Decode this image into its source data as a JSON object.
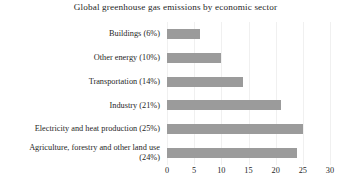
{
  "chart_data": {
    "type": "bar",
    "orientation": "horizontal",
    "title": "Global greenhouse gas emissions  by economic sector",
    "xlabel": "",
    "ylabel": "",
    "xlim": [
      0,
      30
    ],
    "xticks": [
      "0",
      "5",
      "10",
      "15",
      "20",
      "25",
      "30"
    ],
    "grid": "vertical-light",
    "legend": "none",
    "bar_color": "#9b9b9b",
    "background_color": "#ffffff",
    "categories": [
      "Buildings (6%)",
      "Other energy (10%)",
      "Transportation (14%)",
      "Industry (21%)",
      "Electricity and heat production (25%)",
      "Agriculture, forestry and other land use (24%)"
    ],
    "category_lines": [
      [
        "Buildings (6%)"
      ],
      [
        "Other energy (10%)"
      ],
      [
        "Transportation (14%)"
      ],
      [
        "Industry (21%)"
      ],
      [
        "Electricity and heat production (25%)"
      ],
      [
        "Agriculture, forestry and other land use",
        "(24%)"
      ]
    ],
    "values": [
      6,
      10,
      14,
      21,
      25,
      24
    ]
  }
}
